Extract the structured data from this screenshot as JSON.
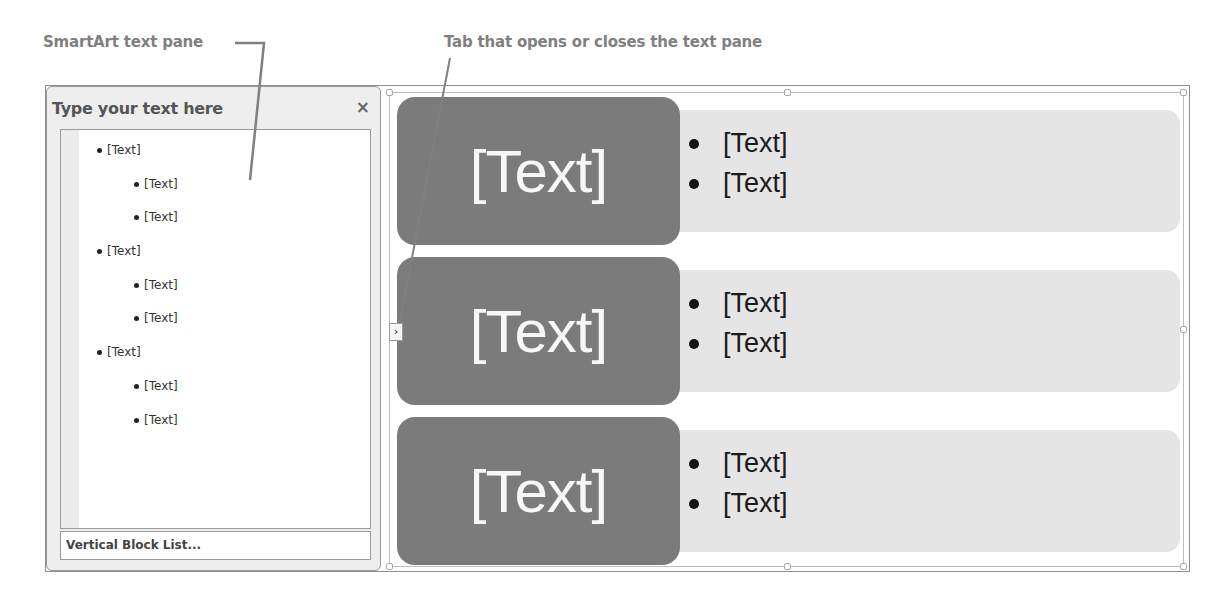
{
  "callouts": {
    "text_pane": "SmartArt text pane",
    "toggle_tab": "Tab that opens or closes the text pane"
  },
  "text_pane": {
    "title": "Type your text here",
    "close_icon": "×",
    "items": [
      {
        "level": 1,
        "label": "[Text]"
      },
      {
        "level": 2,
        "label": "[Text]"
      },
      {
        "level": 2,
        "label": "[Text]"
      },
      {
        "level": 1,
        "label": "[Text]"
      },
      {
        "level": 2,
        "label": "[Text]"
      },
      {
        "level": 2,
        "label": "[Text]"
      },
      {
        "level": 1,
        "label": "[Text]"
      },
      {
        "level": 2,
        "label": "[Text]"
      },
      {
        "level": 2,
        "label": "[Text]"
      }
    ],
    "footer": "Vertical Block List..."
  },
  "toggle_tab": {
    "icon": "chevron-right",
    "glyph": "›"
  },
  "diagram": {
    "layout": "Vertical Block List",
    "colors": {
      "block": "#7b7b7b",
      "bar": "#e5e5e5",
      "block_text": "#f7f7f7"
    },
    "rows": [
      {
        "heading": "[Text]",
        "bullets": [
          "[Text]",
          "[Text]"
        ]
      },
      {
        "heading": "[Text]",
        "bullets": [
          "[Text]",
          "[Text]"
        ]
      },
      {
        "heading": "[Text]",
        "bullets": [
          "[Text]",
          "[Text]"
        ]
      }
    ]
  }
}
